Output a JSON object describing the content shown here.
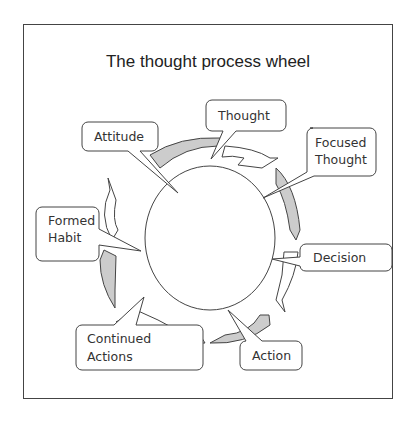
{
  "title": "The thought process wheel",
  "nodes": [
    {
      "id": "thought",
      "label": "Thought"
    },
    {
      "id": "focused",
      "label": "Focused Thought",
      "line1": "Focused",
      "line2": "Thought"
    },
    {
      "id": "decision",
      "label": "Decision"
    },
    {
      "id": "action",
      "label": "Action"
    },
    {
      "id": "continued",
      "label": "Continued Actions",
      "line1": "Continued",
      "line2": "Actions"
    },
    {
      "id": "habit",
      "label": "Formed Habit",
      "line1": "Formed",
      "line2": "Habit"
    },
    {
      "id": "attitude",
      "label": "Attitude"
    }
  ],
  "colors": {
    "arrow_fill": "#cccccc",
    "stroke": "#444444"
  }
}
